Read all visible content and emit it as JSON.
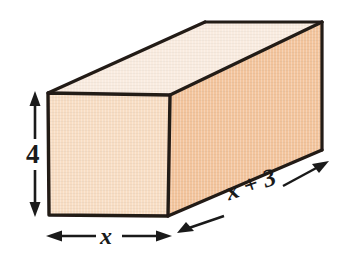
{
  "figure": {
    "kind": "rectangular-prism-dimension-diagram",
    "background_color": "#ffffff",
    "outline_color": "#231a17"
  },
  "solid": {
    "name": "rectangular-prism",
    "faces": {
      "front": {
        "name": "front-face",
        "fill": "#f8ddc3",
        "points": "48,93 170,95 168,216 49,215"
      },
      "right": {
        "name": "right-face",
        "fill": "#f3c49c",
        "points": "170,95 322,22 322,150 168,216"
      },
      "top": {
        "name": "top-face",
        "fill": "#f9ebdf",
        "points": "48,93 205,22 322,22 170,95"
      }
    }
  },
  "dimensions": [
    {
      "id": "height",
      "label": "4",
      "style": "upright",
      "arrow": "double-headed-vertical",
      "description": "height of the prism front face"
    },
    {
      "id": "width",
      "label": "x",
      "style": "italic",
      "arrow": "double-headed-horizontal",
      "description": "width of the prism front face"
    },
    {
      "id": "depth",
      "label": "x + 3",
      "style": "italic",
      "arrow": "double-headed-diagonal",
      "description": "depth of the prism along the receding edge"
    }
  ],
  "colors": {
    "front_face": "#f8ddc3",
    "right_face": "#f3c49c",
    "top_face": "#f9ebdf",
    "outline": "#231a17",
    "arrow": "#1a1a1a",
    "text": "#1a1a1a"
  }
}
